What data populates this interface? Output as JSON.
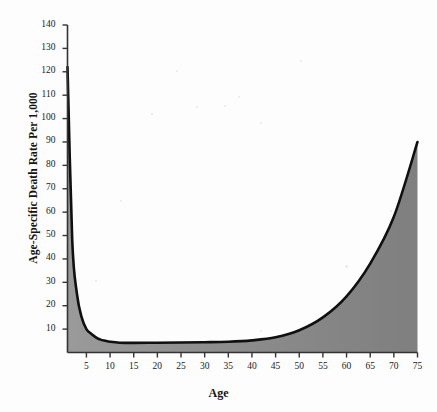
{
  "chart_data": {
    "type": "area",
    "title": "",
    "xlabel": "Age",
    "ylabel": "Age-Specific Death Rate Per 1,000",
    "xlim": [
      1,
      75
    ],
    "ylim": [
      0,
      140
    ],
    "grid": false,
    "legend": null,
    "xticks": [
      5,
      10,
      15,
      20,
      25,
      30,
      35,
      40,
      45,
      50,
      55,
      60,
      65,
      70,
      75
    ],
    "yticks": [
      10,
      20,
      30,
      40,
      50,
      60,
      70,
      80,
      90,
      100,
      110,
      120,
      130,
      140
    ],
    "series": [
      {
        "name": "Age-Specific Death Rate Per 1,000",
        "x": [
          1,
          2,
          3,
          4,
          5,
          6,
          7,
          8,
          9,
          10,
          12,
          15,
          20,
          25,
          30,
          35,
          40,
          45,
          50,
          55,
          60,
          65,
          70,
          75
        ],
        "values": [
          122,
          48,
          25,
          15,
          10,
          8,
          6.5,
          5.5,
          5,
          4.6,
          4.2,
          4.1,
          4.2,
          4.3,
          4.4,
          4.6,
          5.2,
          6.5,
          9.5,
          15,
          24,
          38,
          58,
          90
        ]
      }
    ],
    "fill_color": "#8a8a8a",
    "line_color": "#101010",
    "axis_color": "#3a3a3a",
    "background": "#fdfdfd"
  },
  "axis_labels": {
    "y_title": "Age-Specific Death Rate Per 1,000",
    "x_title": "Age",
    "y_ticks": [
      "10",
      "20",
      "30",
      "40",
      "50",
      "60",
      "70",
      "80",
      "90",
      "100",
      "110",
      "120",
      "130",
      "140"
    ],
    "x_ticks": [
      "5",
      "10",
      "15",
      "20",
      "25",
      "30",
      "35",
      "40",
      "45",
      "50",
      "55",
      "60",
      "65",
      "70",
      "75"
    ]
  }
}
